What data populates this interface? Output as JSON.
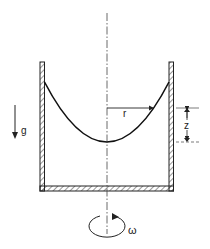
{
  "figure": {
    "labels": {
      "gravity": "g",
      "radius": "r",
      "height": "z",
      "angular_velocity": "ω"
    },
    "colors": {
      "stroke": "#222222",
      "background": "#ffffff"
    }
  }
}
